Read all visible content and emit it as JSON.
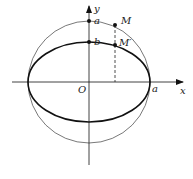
{
  "diagram": {
    "axes": {
      "x_label": "x",
      "y_label": "y",
      "origin_label": "O"
    },
    "labels": {
      "a_top": "a",
      "b_top": "b",
      "a_right": "a",
      "point_M": "M",
      "point_M_prime": "M′"
    },
    "shapes": {
      "circle": {
        "radius_label": "a",
        "stroke": "#555555"
      },
      "ellipse": {
        "semi_major_label": "a",
        "semi_minor_label": "b",
        "stroke": "#111111"
      },
      "dashed_line": {
        "from": "M",
        "to": "x-axis",
        "through": "M′"
      }
    },
    "colors": {
      "ink": "#111111",
      "thin_ink": "#555555",
      "background": "#ffffff"
    }
  }
}
